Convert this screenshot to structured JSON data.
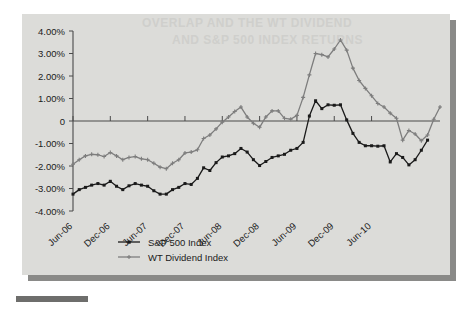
{
  "figure": {
    "background_color": "#dcdcd9",
    "shadow_color": "#8a8a88",
    "ghost_text_line1": "OVERLAP AND THE WT DIVIDEND",
    "ghost_text_line2": "AND S&P 500 INDEX RETURNS"
  },
  "chart_data": {
    "type": "line",
    "title": "",
    "xlabel": "",
    "ylabel": "",
    "ylim": [
      -4.0,
      4.0
    ],
    "yticks": [
      4.0,
      3.0,
      2.0,
      1.0,
      0,
      -1.0,
      -2.0,
      -3.0,
      -4.0
    ],
    "ytick_labels": [
      "4.00%",
      "3.00%",
      "2.00%",
      "1.00%",
      "0",
      "-1.00%",
      "-2.00%",
      "-3.00%",
      "-4.00%"
    ],
    "xtick_labels": [
      "Jun-06",
      "Dec-06",
      "Jun-07",
      "Dec-07",
      "Jun-08",
      "Dec-08",
      "Jun-09",
      "Dec-09",
      "Jun-10"
    ],
    "xtick_indices": [
      0,
      6,
      12,
      18,
      24,
      30,
      36,
      42,
      48
    ],
    "grid": false,
    "legend_position": "bottom-left",
    "zero_line": true,
    "series": [
      {
        "name": "S&P 500 Index",
        "color": "#1a1a1a",
        "marker": "square",
        "values": [
          -3.25,
          -3.05,
          -2.95,
          -2.85,
          -2.78,
          -2.85,
          -2.68,
          -2.9,
          -3.05,
          -2.88,
          -2.78,
          -2.85,
          -2.9,
          -3.1,
          -3.25,
          -3.25,
          -3.05,
          -2.95,
          -2.78,
          -2.82,
          -2.55,
          -2.08,
          -2.2,
          -1.85,
          -1.6,
          -1.55,
          -1.45,
          -1.22,
          -1.38,
          -1.72,
          -1.98,
          -1.8,
          -1.62,
          -1.55,
          -1.48,
          -1.3,
          -1.22,
          -0.95,
          0.22,
          0.9,
          0.55,
          0.72,
          0.7,
          0.72,
          0.05,
          -0.55,
          -0.95,
          -1.1,
          -1.1,
          -1.12,
          -1.1,
          -1.82,
          -1.45,
          -1.62,
          -1.95,
          -1.72,
          -1.3,
          -0.85
        ]
      },
      {
        "name": "WT Dividend Index",
        "color": "#7d7d7d",
        "marker": "cross",
        "values": [
          -1.92,
          -1.72,
          -1.55,
          -1.48,
          -1.5,
          -1.58,
          -1.4,
          -1.55,
          -1.72,
          -1.62,
          -1.58,
          -1.68,
          -1.72,
          -1.88,
          -2.05,
          -2.12,
          -1.88,
          -1.72,
          -1.42,
          -1.38,
          -1.28,
          -0.78,
          -0.62,
          -0.35,
          -0.05,
          0.18,
          0.42,
          0.62,
          0.18,
          -0.1,
          -0.28,
          0.18,
          0.45,
          0.45,
          0.12,
          0.08,
          0.25,
          1.05,
          2.05,
          3.0,
          2.95,
          2.85,
          3.2,
          3.6,
          3.15,
          2.35,
          1.8,
          1.45,
          1.12,
          0.78,
          0.62,
          0.35,
          0.12,
          -0.85,
          -0.42,
          -0.58,
          -0.88,
          -0.62,
          0.08,
          0.62
        ]
      }
    ]
  },
  "legend": {
    "items": [
      {
        "label": "S&P 500 Index",
        "color": "#1a1a1a",
        "marker": "square"
      },
      {
        "label": "WT Dividend Index",
        "color": "#7d7d7d",
        "marker": "cross"
      }
    ]
  }
}
